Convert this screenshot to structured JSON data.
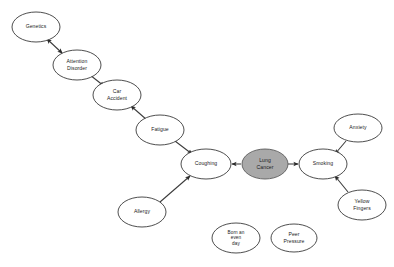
{
  "diagram": {
    "background_color": "#ffffff",
    "node_fill": "#ffffff",
    "node_shaded_fill": "#a9a9a9",
    "node_stroke": "#3a3a3a",
    "edge_color": "#3a3a3a",
    "nodes": [
      {
        "id": "genetics",
        "label": "Genetics",
        "lines": [
          "Genetics"
        ],
        "cx": 36,
        "cy": 27,
        "rx": 24,
        "ry": 15,
        "shaded": false
      },
      {
        "id": "attention-disorder",
        "label": "Attention Disorder",
        "lines": [
          "Attention",
          "Disorder"
        ],
        "cx": 77,
        "cy": 65,
        "rx": 24,
        "ry": 15,
        "shaded": false
      },
      {
        "id": "car-accident",
        "label": "Car Accident",
        "lines": [
          "Car",
          "Accident"
        ],
        "cx": 117,
        "cy": 95,
        "rx": 24,
        "ry": 15,
        "shaded": false
      },
      {
        "id": "fatigue",
        "label": "Fatigue",
        "lines": [
          "Fatigue"
        ],
        "cx": 160,
        "cy": 130,
        "rx": 24,
        "ry": 15,
        "shaded": false
      },
      {
        "id": "coughing",
        "label": "Coughing",
        "lines": [
          "Coughing"
        ],
        "cx": 206,
        "cy": 164,
        "rx": 25,
        "ry": 15,
        "shaded": false
      },
      {
        "id": "lung-cancer",
        "label": "Lung Cancer",
        "lines": [
          "Lung",
          "Cancer"
        ],
        "cx": 265,
        "cy": 164,
        "rx": 23,
        "ry": 15,
        "shaded": true
      },
      {
        "id": "smoking",
        "label": "Smoking",
        "lines": [
          "Smoking"
        ],
        "cx": 323,
        "cy": 164,
        "rx": 24,
        "ry": 15,
        "shaded": false
      },
      {
        "id": "anxiety",
        "label": "Anxiety",
        "lines": [
          "Anxiety"
        ],
        "cx": 358,
        "cy": 128,
        "rx": 24,
        "ry": 14,
        "shaded": false
      },
      {
        "id": "yellow-fingers",
        "label": "Yellow Fingers",
        "lines": [
          "Yellow",
          "Fingers"
        ],
        "cx": 362,
        "cy": 205,
        "rx": 24,
        "ry": 15,
        "shaded": false
      },
      {
        "id": "allergy",
        "label": "Allergy",
        "lines": [
          "Allergy"
        ],
        "cx": 142,
        "cy": 212,
        "rx": 24,
        "ry": 15,
        "shaded": false
      },
      {
        "id": "born-an-even-day",
        "label": "Born an even day",
        "lines": [
          "Born an",
          "even",
          "day"
        ],
        "cx": 236,
        "cy": 238,
        "rx": 24,
        "ry": 15,
        "shaded": false
      },
      {
        "id": "peer-pressure",
        "label": "Peer Pressure",
        "lines": [
          "Peer",
          "Pressure"
        ],
        "cx": 294,
        "cy": 238,
        "rx": 23,
        "ry": 14,
        "shaded": false
      }
    ],
    "edges": [
      {
        "id": "genetics-attention-disorder",
        "from": "attention-disorder",
        "to": "genetics",
        "direction": "both",
        "x1": 62,
        "y1": 53,
        "x2": 47,
        "y2": 39
      },
      {
        "id": "attention-disorder-car-accident",
        "from": "attention-disorder",
        "to": "car-accident",
        "direction": "forward",
        "x1": 90,
        "y1": 75,
        "x2": 104,
        "y2": 86
      },
      {
        "id": "fatigue-car-accident",
        "from": "fatigue",
        "to": "car-accident",
        "direction": "forward",
        "x1": 147,
        "y1": 120,
        "x2": 131,
        "y2": 106
      },
      {
        "id": "fatigue-coughing",
        "from": "fatigue",
        "to": "coughing",
        "direction": "forward",
        "x1": 175,
        "y1": 141,
        "x2": 192,
        "y2": 154
      },
      {
        "id": "lung-cancer-coughing",
        "from": "lung-cancer",
        "to": "coughing",
        "direction": "forward",
        "x1": 241,
        "y1": 164,
        "x2": 232,
        "y2": 164
      },
      {
        "id": "lung-cancer-smoking",
        "from": "lung-cancer",
        "to": "smoking",
        "direction": "forward",
        "x1": 288,
        "y1": 164,
        "x2": 298,
        "y2": 164
      },
      {
        "id": "anxiety-smoking",
        "from": "anxiety",
        "to": "smoking",
        "direction": "forward",
        "x1": 346,
        "y1": 141,
        "x2": 335,
        "y2": 154
      },
      {
        "id": "yellow-fingers-smoking",
        "from": "yellow-fingers",
        "to": "smoking",
        "direction": "forward",
        "x1": 348,
        "y1": 192,
        "x2": 335,
        "y2": 176
      },
      {
        "id": "allergy-coughing",
        "from": "allergy",
        "to": "coughing",
        "direction": "forward",
        "x1": 160,
        "y1": 202,
        "x2": 190,
        "y2": 176
      }
    ]
  }
}
